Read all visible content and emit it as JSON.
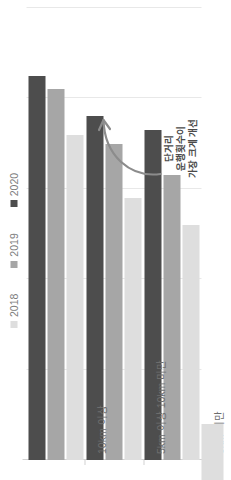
{
  "chart_data": {
    "type": "bar",
    "orientation": "horizontal",
    "title": "",
    "subtitle": "",
    "xlabel": "",
    "ylabel": "",
    "grid": true,
    "legend_position": "top-right",
    "categories": [
      "5km 미만",
      "5km 이상 10km 미만",
      "10km 이상"
    ],
    "series": [
      {
        "name": "2018",
        "color": "#dedede",
        "values": [
          52,
          58,
          72
        ]
      },
      {
        "name": "2019",
        "color": "#a6a6a6",
        "values": [
          63,
          70,
          82
        ]
      },
      {
        "name": "2020",
        "color": "#4d4d4d",
        "values": [
          73,
          76,
          85
        ]
      }
    ],
    "xlim": [
      0,
      100
    ],
    "gridline_values": [
      20,
      40,
      60,
      80,
      100
    ],
    "annotations": [
      {
        "name": "short-distance-callout",
        "lines": [
          "단거리",
          "운행횟수이",
          "가장 크게 개선"
        ],
        "arrow": "curved-arrow-pointing-left-up"
      }
    ]
  },
  "legend": {
    "items": [
      {
        "label": "2018",
        "color": "#dedede"
      },
      {
        "label": "2019",
        "color": "#a6a6a6"
      },
      {
        "label": "2020",
        "color": "#4d4d4d"
      }
    ]
  },
  "axis": {
    "category_labels": [
      "5km 미만",
      "5km 이상 10km 미만",
      "10km 이상"
    ]
  },
  "annotation": {
    "line1": "단거리",
    "line2": "운행횟수이",
    "line3": "가장 크게 개선"
  },
  "colors": {
    "series_2018": "#dedede",
    "series_2019": "#a6a6a6",
    "series_2020": "#4d4d4d",
    "gridline": "#e8e8e8",
    "axis": "#d2d2d2",
    "text": "#6d6d6d",
    "background": "#ffffff"
  },
  "footer_fragment": {
    "visible": true,
    "color": "#dedede"
  }
}
